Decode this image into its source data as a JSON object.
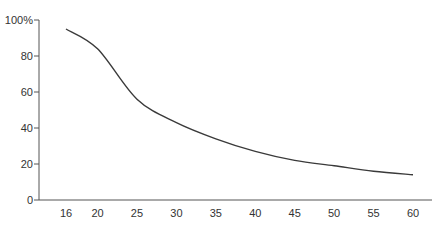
{
  "chart_data": {
    "type": "line",
    "title": "",
    "xlabel": "",
    "ylabel": "",
    "x": [
      16,
      20,
      25,
      30,
      35,
      40,
      45,
      50,
      55,
      60
    ],
    "series": [
      {
        "name": "curve",
        "values": [
          95,
          84,
          56,
          43,
          34,
          27,
          22,
          19,
          16,
          14
        ]
      }
    ],
    "x_ticks": [
      "16",
      "20",
      "25",
      "30",
      "35",
      "40",
      "45",
      "50",
      "55",
      "60"
    ],
    "y_ticks": [
      "0",
      "20",
      "40",
      "60",
      "80",
      "100%"
    ],
    "y_tick_values": [
      0,
      20,
      40,
      60,
      80,
      100
    ],
    "ylim": [
      0,
      100
    ],
    "xlim": [
      12,
      62
    ],
    "grid": false,
    "legend": "none",
    "line_color": "#3a3a3a"
  }
}
